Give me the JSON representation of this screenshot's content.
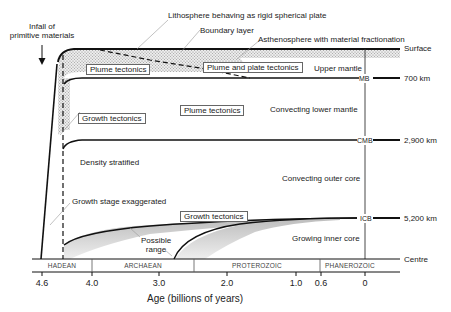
{
  "diagram": {
    "title_annotations": {
      "infall": "Infall of\nprimitive materials",
      "infall_line1": "Infall of",
      "infall_line2": "primitive materials",
      "lithosphere": "Lithosphere behaving as rigid spherical plate",
      "boundary_layer": "Boundary layer",
      "asthenosphere": "Asthenosphere with material fractionation",
      "growth_stage": "Growth stage exaggerated",
      "possible_range_line1": "Possible",
      "possible_range_line2": "range"
    },
    "regime_boxes": {
      "plume_tectonics_upper": "Plume tectonics",
      "plume_and_plate": "Plume and plate tectonics",
      "plume_tectonics_lower": "Plume tectonics",
      "growth_tectonics_upper": "Growth tectonics",
      "growth_tectonics_lower": "Growth tectonics"
    },
    "layer_labels": {
      "upper_mantle": "Upper mantle",
      "lower_mantle": "Convecting lower mantle",
      "density_stratified": "Density stratified",
      "outer_core": "Convecting outer core",
      "inner_core": "Growing inner  core"
    },
    "boundaries": [
      {
        "abbr": "",
        "label": "Surface",
        "depth": ""
      },
      {
        "abbr": "MB",
        "label": "",
        "depth": "700 km"
      },
      {
        "abbr": "CMB",
        "label": "",
        "depth": "2,900 km"
      },
      {
        "abbr": "ICB",
        "label": "",
        "depth": "5,200 km"
      },
      {
        "abbr": "",
        "label": "Centre",
        "depth": ""
      }
    ],
    "eras": [
      "HADEAN",
      "ARCHAEAN",
      "PROTEROZOIC",
      "PHANEROZOIC"
    ],
    "x_axis": {
      "title": "Age (billions of years)",
      "ticks": [
        "4.6",
        "4.0",
        "3.0",
        "2.0",
        "1.0",
        "0.6",
        "0"
      ]
    },
    "colors": {
      "line": "#111111",
      "stipple": "#9a9a9a",
      "shade": "#cfcfcf"
    }
  }
}
